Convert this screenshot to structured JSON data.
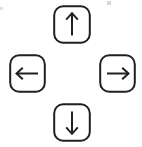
{
  "figure": {
    "name": "arrow-key-cluster",
    "background_color": "#ffffff",
    "stroke_color": "#231f20",
    "keycap_fill": "#ffffff",
    "keycap_stroke_width": 2,
    "keycap_corner_radius": 9,
    "arrow_stroke_width": 2
  },
  "keys": [
    {
      "id": "up",
      "label": "Up Arrow",
      "glyph": "↑",
      "icon_name": "arrow-up-icon",
      "position": "top",
      "x": 53,
      "y": 5,
      "width": 38,
      "height": 39
    },
    {
      "id": "left",
      "label": "Left Arrow",
      "glyph": "←",
      "icon_name": "arrow-left-icon",
      "position": "left",
      "x": 9,
      "y": 54,
      "width": 37,
      "height": 39
    },
    {
      "id": "right",
      "label": "Right Arrow",
      "glyph": "→",
      "icon_name": "arrow-right-icon",
      "position": "right",
      "x": 99,
      "y": 54,
      "width": 37,
      "height": 39
    },
    {
      "id": "down",
      "label": "Down Arrow",
      "glyph": "↓",
      "icon_name": "arrow-down-icon",
      "position": "bottom",
      "x": 53,
      "y": 103,
      "width": 38,
      "height": 39
    }
  ],
  "artifacts": [
    {
      "id": "speck-top-right",
      "x": 107,
      "y": 1,
      "width": 4,
      "height": 4,
      "color": "#d8d8d8"
    },
    {
      "id": "speck-left-edge",
      "x": 0,
      "y": 7,
      "width": 3,
      "height": 3,
      "color": "#e2e2e2"
    }
  ]
}
